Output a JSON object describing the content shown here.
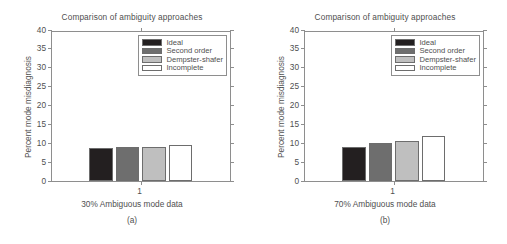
{
  "figure": {
    "ylabel": "Percent mode misdiagnosis",
    "title": "Comparison of ambiguity approaches",
    "ytick_labels": [
      "40",
      "35",
      "30",
      "25",
      "20",
      "15",
      "10",
      "5",
      "0"
    ],
    "xtick_label": "1",
    "colors": {
      "ideal": "#231f20",
      "second_order": "#6e6e6e",
      "dempster_shafer": "#bfbfbf",
      "incomplete": "#ffffff",
      "axis": "#8e8e8e",
      "text": "#4f4f4f",
      "background": "#ffffff"
    },
    "legend": [
      {
        "label": "Ideal",
        "swatch": "#231f20"
      },
      {
        "label": "Second order",
        "swatch": "#6e6e6e"
      },
      {
        "label": "Dempster-shafer",
        "swatch": "#bfbfbf"
      },
      {
        "label": "Incomplete",
        "swatch": "#ffffff"
      }
    ]
  },
  "panels": [
    {
      "id": "a",
      "title": "Comparison of ambiguity approaches",
      "xlabel": "30% Ambiguous mode data",
      "subcaption": "(a)",
      "chart_data": {
        "type": "bar",
        "title": "Comparison of ambiguity approaches",
        "xlabel": "30% Ambiguous mode data",
        "ylabel": "Percent mode misdiagnosis",
        "categories": [
          "1"
        ],
        "xtick_labels": [
          "1"
        ],
        "ylim": [
          0,
          40
        ],
        "ytick_values": [
          0,
          5,
          10,
          15,
          20,
          25,
          30,
          35,
          40
        ],
        "grid": false,
        "legend_position": "upper right",
        "series": [
          {
            "name": "Ideal",
            "values": [
              8.7
            ],
            "color": "#231f20"
          },
          {
            "name": "Second order",
            "values": [
              9.0
            ],
            "color": "#6e6e6e"
          },
          {
            "name": "Dempster-shafer",
            "values": [
              9.1
            ],
            "color": "#bfbfbf"
          },
          {
            "name": "Incomplete",
            "values": [
              9.6
            ],
            "color": "#ffffff"
          }
        ]
      }
    },
    {
      "id": "b",
      "title": "Comparison of ambiguity approaches",
      "xlabel": "70% Ambiguous mode data",
      "subcaption": "(b)",
      "chart_data": {
        "type": "bar",
        "title": "Comparison of ambiguity approaches",
        "xlabel": "70% Ambiguous mode data",
        "ylabel": "Percent mode misdiagnosis",
        "categories": [
          "1"
        ],
        "xtick_labels": [
          "1"
        ],
        "ylim": [
          0,
          40
        ],
        "ytick_values": [
          0,
          5,
          10,
          15,
          20,
          25,
          30,
          35,
          40
        ],
        "grid": false,
        "legend_position": "upper right",
        "series": [
          {
            "name": "Ideal",
            "values": [
              8.9
            ],
            "color": "#231f20"
          },
          {
            "name": "Second order",
            "values": [
              10.1
            ],
            "color": "#6e6e6e"
          },
          {
            "name": "Dempster-shafer",
            "values": [
              10.5
            ],
            "color": "#bfbfbf"
          },
          {
            "name": "Incomplete",
            "values": [
              11.9
            ],
            "color": "#ffffff"
          }
        ]
      }
    }
  ],
  "chart_data": [
    {
      "type": "bar",
      "title": "Comparison of ambiguity approaches",
      "xlabel": "30% Ambiguous mode data",
      "ylabel": "Percent mode misdiagnosis",
      "subcaption": "(a)",
      "categories": [
        "1"
      ],
      "ylim": [
        0,
        40
      ],
      "ytick_values": [
        0,
        5,
        10,
        15,
        20,
        25,
        30,
        35,
        40
      ],
      "grid": false,
      "legend_position": "upper right",
      "series": [
        {
          "name": "Ideal",
          "values": [
            8.7
          ],
          "color": "#231f20"
        },
        {
          "name": "Second order",
          "values": [
            9.0
          ],
          "color": "#6e6e6e"
        },
        {
          "name": "Dempster-shafer",
          "values": [
            9.1
          ],
          "color": "#bfbfbf"
        },
        {
          "name": "Incomplete",
          "values": [
            9.6
          ],
          "color": "#ffffff"
        }
      ]
    },
    {
      "type": "bar",
      "title": "Comparison of ambiguity approaches",
      "xlabel": "70% Ambiguous mode data",
      "ylabel": "Percent mode misdiagnosis",
      "subcaption": "(b)",
      "categories": [
        "1"
      ],
      "ylim": [
        0,
        40
      ],
      "ytick_values": [
        0,
        5,
        10,
        15,
        20,
        25,
        30,
        35,
        40
      ],
      "grid": false,
      "legend_position": "upper right",
      "series": [
        {
          "name": "Ideal",
          "values": [
            8.9
          ],
          "color": "#231f20"
        },
        {
          "name": "Second order",
          "values": [
            10.1
          ],
          "color": "#6e6e6e"
        },
        {
          "name": "Dempster-shafer",
          "values": [
            10.5
          ],
          "color": "#bfbfbf"
        },
        {
          "name": "Incomplete",
          "values": [
            11.9
          ],
          "color": "#ffffff"
        }
      ]
    }
  ]
}
